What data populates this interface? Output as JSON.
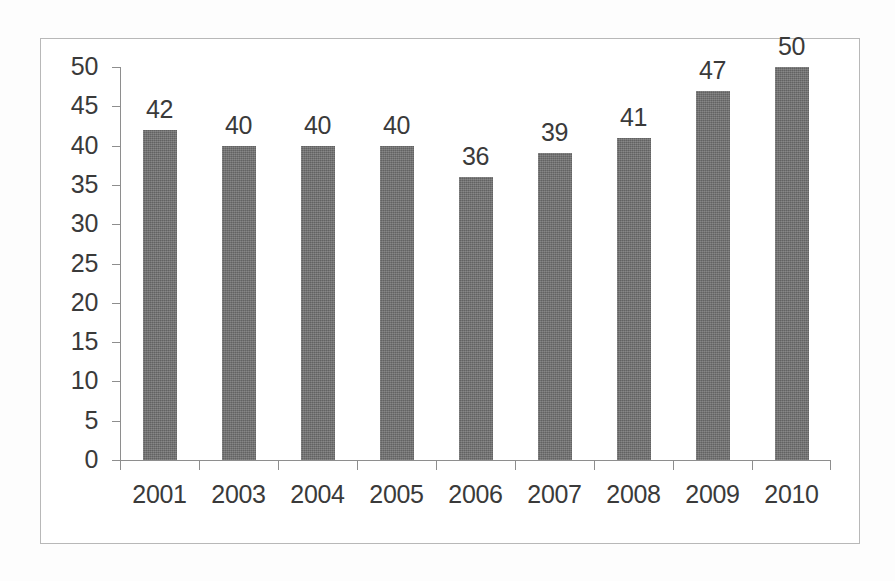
{
  "chart_data": {
    "type": "bar",
    "title": "",
    "subtitle": "",
    "xlabel": "",
    "ylabel": "",
    "categories": [
      "2001",
      "2003",
      "2004",
      "2005",
      "2006",
      "2007",
      "2008",
      "2009",
      "2010"
    ],
    "values": [
      42,
      40,
      40,
      40,
      36,
      39,
      41,
      47,
      50
    ],
    "data_labels": [
      "42",
      "40",
      "40",
      "40",
      "36",
      "39",
      "41",
      "47",
      "50"
    ],
    "ylim": [
      0,
      50
    ],
    "y_ticks": [
      0,
      5,
      10,
      15,
      20,
      25,
      30,
      35,
      40,
      45,
      50
    ],
    "y_tick_labels": [
      "0",
      "5",
      "10",
      "15",
      "20",
      "25",
      "30",
      "35",
      "40",
      "45",
      "50"
    ],
    "grid": false,
    "legend": false,
    "legend_position": "none",
    "series": [
      {
        "name": "",
        "values": [
          42,
          40,
          40,
          40,
          36,
          39,
          41,
          47,
          50
        ]
      }
    ]
  },
  "style": {
    "bar_color": "#6e6e6e",
    "axis_color": "#8e8e8e",
    "text_color": "#3a3a3a",
    "frame_color": "#b8b8b8",
    "background": "#ffffff"
  }
}
